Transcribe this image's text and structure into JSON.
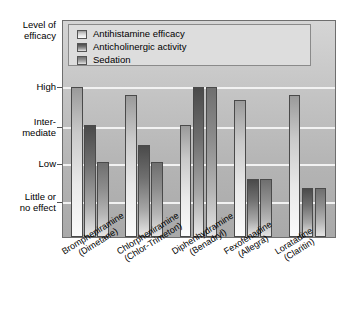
{
  "chart_data": {
    "type": "bar",
    "title": "",
    "subtitle": "",
    "xlabel": "",
    "ylabel": "Level of\nefficacy",
    "ylim": [
      0,
      4
    ],
    "grid": true,
    "legend_position": "top-left-inside",
    "y_tick_labels": [
      "Little or\nno effect",
      "Low",
      "Inter-\nmediate",
      "High"
    ],
    "y_tick_values": [
      1,
      2,
      3,
      4
    ],
    "categories": [
      "Brompheniramine\n(Dimetane)",
      "Chlorpheniramine\n(Chlor-Trimeton)",
      "Diphenhydramine\n(Benadryl)",
      "Fexofenadine\n(Allegra)",
      "Loratadine\n(Claritin)"
    ],
    "series": [
      {
        "name": "Antihistamine efficacy",
        "color": "#e0e0e0",
        "values": [
          4.0,
          3.8,
          3.0,
          3.65,
          3.8
        ]
      },
      {
        "name": "Anticholinergic activity",
        "color": "#5a5a5a",
        "values": [
          3.0,
          2.45,
          4.0,
          1.55,
          1.3
        ]
      },
      {
        "name": "Sedation",
        "color": "#8a8a8a",
        "values": [
          2.0,
          2.0,
          4.0,
          1.55,
          1.3
        ]
      }
    ]
  },
  "legend": {
    "items": [
      {
        "label": "Antihistamine efficacy"
      },
      {
        "label": "Anticholinergic activity"
      },
      {
        "label": "Sedation"
      }
    ]
  },
  "axis": {
    "y_title": "Level of\nefficacy",
    "ticks": [
      {
        "label": "High"
      },
      {
        "label": "Inter-\nmediate"
      },
      {
        "label": "Low"
      },
      {
        "label": "Little or\nno effect"
      }
    ]
  },
  "x_axis": {
    "labels": [
      "Brompheniramine\n(Dimetane)",
      "Chlorpheniramine\n(Chlor-Trimeton)",
      "Diphenhydramine\n(Benadryl)",
      "Fexofenadine\n(Allegra)",
      "Loratadine\n(Claritin)"
    ]
  },
  "colors": {
    "plot_background": "#c2c2c2",
    "gridline": "#f2f2f2",
    "frame_border": "#6e6e6e",
    "legend_background": "#dddddd"
  }
}
